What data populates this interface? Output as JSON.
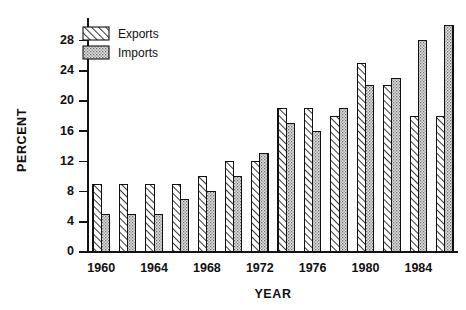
{
  "chart_data": {
    "type": "bar",
    "title": "",
    "xlabel": "YEAR",
    "ylabel": "PERCENT",
    "xlim": [
      1959.3,
      1986.7
    ],
    "ylim": [
      0,
      31
    ],
    "grid": false,
    "legend_position": "top-left-inside",
    "ytick_labels": [
      "0",
      "4",
      "8",
      "12",
      "16",
      "20",
      "24",
      "28"
    ],
    "ytick_values": [
      0,
      4,
      8,
      12,
      16,
      20,
      24,
      28
    ],
    "xtick_labels": [
      "1960",
      "1964",
      "1968",
      "1972",
      "1976",
      "1980",
      "1984"
    ],
    "xtick_values": [
      1960,
      1964,
      1968,
      1972,
      1976,
      1980,
      1984
    ],
    "categories": [
      "1960",
      "1962",
      "1964",
      "1966",
      "1968",
      "1970",
      "1972",
      "1974",
      "1976",
      "1978",
      "1980",
      "1982",
      "1984",
      "1986"
    ],
    "series": [
      {
        "name": "Exports",
        "pattern": "diagonal-hatch",
        "color": "#ffffff",
        "values": [
          9,
          9,
          9,
          9,
          10,
          12,
          12,
          19,
          19,
          18,
          25,
          22,
          18,
          18
        ]
      },
      {
        "name": "Imports",
        "pattern": "stipple-dots",
        "color": "#d8d8d8",
        "values": [
          5,
          5,
          5,
          7,
          8,
          10,
          13,
          17,
          16,
          19,
          22,
          23,
          28,
          30
        ]
      }
    ],
    "annotations": []
  },
  "legend": {
    "entries": [
      {
        "label": "Exports",
        "swatch": "diagonal-hatch"
      },
      {
        "label": "Imports",
        "swatch": "stipple-dots"
      }
    ]
  },
  "colors": {
    "axis": "#141414",
    "exports_fill": "#ffffff",
    "imports_fill": "#d8d8d8",
    "outline": "#111111",
    "background": "#ffffff"
  }
}
